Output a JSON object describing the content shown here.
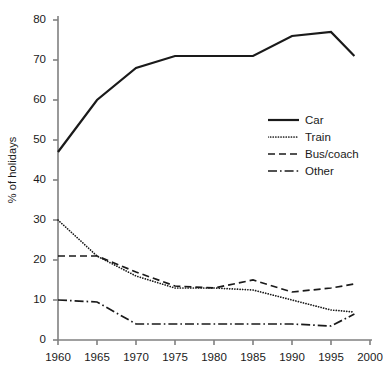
{
  "chart_data": {
    "type": "line",
    "title": "",
    "subtitle": "",
    "xlabel": "",
    "ylabel": "% of holidays",
    "xlim": [
      1960,
      2000
    ],
    "ylim": [
      0,
      80
    ],
    "xticks": [
      1960,
      1965,
      1970,
      1975,
      1980,
      1985,
      1990,
      1995,
      2000
    ],
    "yticks": [
      0,
      10,
      20,
      30,
      40,
      50,
      60,
      70,
      80
    ],
    "xtick_labels": [
      "1960",
      "1965",
      "1970",
      "1975",
      "1980",
      "1985",
      "1990",
      "1995",
      "2000"
    ],
    "ytick_labels": [
      "0",
      "10",
      "20",
      "30",
      "40",
      "50",
      "60",
      "70",
      "80"
    ],
    "grid": false,
    "legend_position": "right-middle",
    "line_color": "#1a1a1a",
    "axis_color": "#808080",
    "series": [
      {
        "name": "Car",
        "style": "solid",
        "x": [
          1960,
          1965,
          1970,
          1975,
          1980,
          1985,
          1990,
          1995,
          1998
        ],
        "values": [
          47,
          60,
          68,
          71,
          71,
          71,
          76,
          77,
          71
        ]
      },
      {
        "name": "Train",
        "style": "dotted",
        "x": [
          1960,
          1965,
          1970,
          1975,
          1980,
          1985,
          1990,
          1995,
          1998
        ],
        "values": [
          30,
          21,
          16,
          13,
          13,
          12.5,
          10,
          7.5,
          7
        ]
      },
      {
        "name": "Bus/coach",
        "style": "dashed",
        "x": [
          1960,
          1965,
          1970,
          1975,
          1980,
          1985,
          1990,
          1995,
          1998
        ],
        "values": [
          21,
          21,
          17,
          13.5,
          13,
          15,
          12,
          13,
          14
        ]
      },
      {
        "name": "Other",
        "style": "dashdot",
        "x": [
          1960,
          1965,
          1970,
          1975,
          1980,
          1985,
          1990,
          1995,
          1998
        ],
        "values": [
          10,
          9.5,
          4,
          4,
          4,
          4,
          4,
          3.5,
          6.5
        ]
      }
    ]
  },
  "legend": {
    "items": [
      {
        "label": "Car",
        "style": "solid"
      },
      {
        "label": "Train",
        "style": "dotted"
      },
      {
        "label": "Bus/coach",
        "style": "dashed"
      },
      {
        "label": "Other",
        "style": "dashdot"
      }
    ]
  }
}
